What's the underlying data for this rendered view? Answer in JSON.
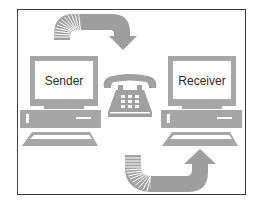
{
  "diagram": {
    "title": "",
    "nodes": [
      {
        "id": "sender",
        "label": "Sender",
        "type": "computer"
      },
      {
        "id": "telephone",
        "label": "",
        "type": "telephone"
      },
      {
        "id": "receiver",
        "label": "Receiver",
        "type": "computer"
      }
    ],
    "edges": [
      {
        "from": "sender",
        "to": "telephone",
        "style": "curved-arrow-top"
      },
      {
        "from": "telephone",
        "to": "receiver",
        "style": "curved-arrow-bottom"
      }
    ],
    "colors": {
      "frame": "#3a3a3a",
      "device_gray": "#a6a6a6",
      "arrow_gray": "#9e9e9e",
      "screen": "#ffffff",
      "text": "#2b2b2b"
    }
  },
  "sender": {
    "label": "Sender"
  },
  "receiver": {
    "label": "Receiver"
  }
}
